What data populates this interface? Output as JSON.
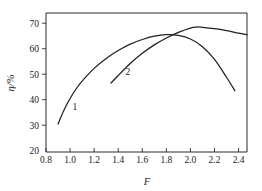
{
  "chart_data": {
    "type": "line",
    "title": "",
    "subtitle": "",
    "xlabel": "F",
    "ylabel": "η/%",
    "xlim": [
      0.8,
      2.47
    ],
    "ylim": [
      19.5,
      74.0
    ],
    "xticks": [
      "0.8",
      "1.0",
      "1.2",
      "1.4",
      "1.6",
      "1.8",
      "2.0",
      "2.2",
      "2.4"
    ],
    "xtick_values": [
      0.8,
      1.0,
      1.2,
      1.4,
      1.6,
      1.8,
      2.0,
      2.2,
      2.4
    ],
    "yticks": [
      "20",
      "30",
      "40",
      "50",
      "60",
      "70"
    ],
    "ytick_values": [
      20,
      30,
      40,
      50,
      60,
      70
    ],
    "grid": false,
    "legend": "inline-curve-labels",
    "annotations": [
      {
        "text": "1",
        "x": 1.04,
        "y": 36.0
      },
      {
        "text": "2",
        "x": 1.48,
        "y": 49.5
      }
    ],
    "series": [
      {
        "name": "1",
        "label": "1",
        "color": "#1f1f1f",
        "x": [
          0.9,
          0.95,
          1.0,
          1.05,
          1.1,
          1.2,
          1.3,
          1.4,
          1.5,
          1.6,
          1.7,
          1.8,
          1.9,
          2.0,
          2.1,
          2.2,
          2.3,
          2.37
        ],
        "y": [
          30.5,
          36.0,
          40.5,
          44.2,
          47.3,
          52.3,
          56.2,
          59.3,
          61.8,
          63.6,
          64.9,
          65.5,
          65.2,
          63.8,
          60.8,
          55.8,
          48.8,
          43.5
        ]
      },
      {
        "name": "2",
        "label": "2",
        "color": "#1f1f1f",
        "x": [
          1.34,
          1.4,
          1.5,
          1.6,
          1.7,
          1.8,
          1.9,
          2.0,
          2.05,
          2.1,
          2.2,
          2.3,
          2.4,
          2.47
        ],
        "y": [
          46.5,
          49.5,
          54.2,
          58.2,
          61.5,
          64.2,
          66.4,
          68.1,
          68.5,
          68.4,
          67.9,
          67.1,
          66.1,
          65.5
        ]
      }
    ]
  },
  "figure": {
    "background": "#ffffff",
    "axis_color": "#2b2b2b",
    "curve_color": "#1f1f1f"
  }
}
